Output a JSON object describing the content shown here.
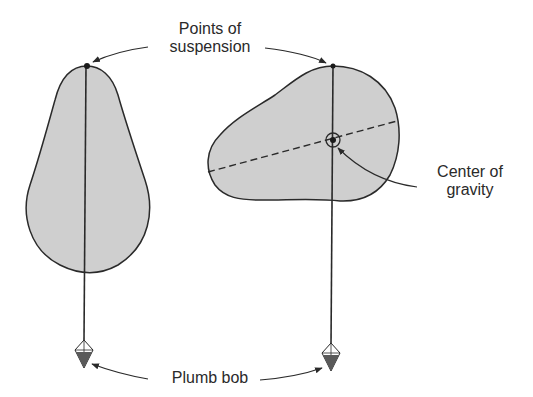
{
  "diagram": {
    "labels": {
      "points_of_suspension_line1": "Points of",
      "points_of_suspension_line2": "suspension",
      "center_of_gravity_line1": "Center of",
      "center_of_gravity_line2": "gravity",
      "plumb_bob": "Plumb bob"
    },
    "colors": {
      "shape_fill": "#cfcfcf",
      "stroke": "#2a2a2a",
      "bob_dark": "#5a5a5a",
      "background": "#ffffff"
    },
    "objects": [
      {
        "name": "pear-shaped-object",
        "suspension_point": [
          87,
          66
        ]
      },
      {
        "name": "irregular-object",
        "suspension_point": [
          333,
          66
        ],
        "center_of_gravity": [
          333,
          140
        ]
      }
    ]
  }
}
